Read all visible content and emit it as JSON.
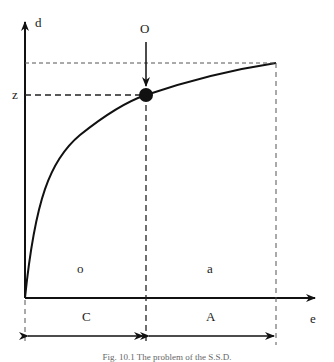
{
  "figure": {
    "y_axis_label": "d",
    "x_axis_label": "e",
    "point_label": "O",
    "z_label": "z",
    "region_left_label": "o",
    "region_right_label": "a",
    "span_left_label": "C",
    "span_right_label": "A",
    "caption": "Fig. 10.1 The problem of the S.S.D."
  }
}
